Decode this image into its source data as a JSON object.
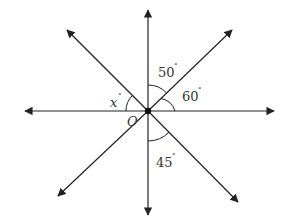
{
  "diagram": {
    "type": "angles-at-a-point",
    "center_label": "O",
    "center": [
      148,
      111
    ],
    "rays": [
      {
        "name": "up",
        "tip": [
          148,
          10
        ]
      },
      {
        "name": "down",
        "tip": [
          148,
          215
        ]
      },
      {
        "name": "left",
        "tip": [
          25,
          111
        ]
      },
      {
        "name": "right",
        "tip": [
          274,
          111
        ]
      },
      {
        "name": "upper-left",
        "tip": [
          67,
          30
        ]
      },
      {
        "name": "upper-right",
        "tip": [
          232,
          30
        ]
      },
      {
        "name": "lower-left",
        "tip": [
          58,
          196
        ]
      },
      {
        "name": "lower-right",
        "tip": [
          238,
          202
        ]
      }
    ],
    "angles": [
      {
        "id": "angle-50",
        "value": "50",
        "unit": "°",
        "between": [
          "up",
          "upper-right"
        ]
      },
      {
        "id": "angle-60",
        "value": "60",
        "unit": "°",
        "between": [
          "upper-right",
          "right"
        ]
      },
      {
        "id": "angle-x",
        "value": "x",
        "unit": "°",
        "between": [
          "upper-left",
          "left"
        ]
      },
      {
        "id": "angle-45",
        "value": "45",
        "unit": "°",
        "between": [
          "down",
          "lower-right"
        ]
      }
    ]
  },
  "labels": {
    "center": "O",
    "x": "x",
    "a50": "50",
    "a60": "60",
    "a45": "45",
    "deg": "°"
  }
}
